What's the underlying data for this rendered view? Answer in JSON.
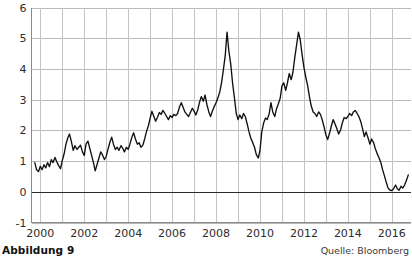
{
  "figure": {
    "caption": "Abbildung 9",
    "source": "Quelle: Bloomberg"
  },
  "chart_data": {
    "type": "line",
    "title": "",
    "subtitle": "",
    "xlabel": "",
    "ylabel": "",
    "xlim": [
      1999.6,
      2016.85
    ],
    "ylim": [
      -1,
      6
    ],
    "grid": true,
    "legend": null,
    "legend_position": "none",
    "y_ticks": [
      6,
      5,
      4,
      3,
      2,
      1,
      0,
      -1
    ],
    "y_tick_labels": [
      "6",
      "5",
      "4",
      "3",
      "2",
      "1",
      "0",
      "-1"
    ],
    "x_ticks": [
      2000,
      2002,
      2004,
      2006,
      2008,
      2010,
      2012,
      2014,
      2016
    ],
    "x_tick_labels": [
      "2000",
      "2002",
      "2004",
      "2006",
      "2008",
      "2010",
      "2012",
      "2014",
      "2016"
    ],
    "x_minor_ticks": [
      2001,
      2003,
      2005,
      2007,
      2009,
      2011,
      2013,
      2015
    ],
    "zero_line": 0,
    "series": [
      {
        "name": "series-1",
        "color": "#101010",
        "x": [
          1999.75,
          1999.83,
          1999.92,
          2000.0,
          2000.08,
          2000.17,
          2000.25,
          2000.33,
          2000.42,
          2000.5,
          2000.58,
          2000.67,
          2000.75,
          2000.83,
          2000.92,
          2001.0,
          2001.08,
          2001.17,
          2001.25,
          2001.33,
          2001.42,
          2001.5,
          2001.58,
          2001.67,
          2001.75,
          2001.83,
          2001.92,
          2002.0,
          2002.08,
          2002.17,
          2002.25,
          2002.33,
          2002.42,
          2002.5,
          2002.58,
          2002.67,
          2002.75,
          2002.83,
          2002.92,
          2003.0,
          2003.08,
          2003.17,
          2003.25,
          2003.33,
          2003.42,
          2003.5,
          2003.58,
          2003.67,
          2003.75,
          2003.83,
          2003.92,
          2004.0,
          2004.08,
          2004.17,
          2004.25,
          2004.33,
          2004.42,
          2004.5,
          2004.58,
          2004.67,
          2004.75,
          2004.83,
          2004.92,
          2005.0,
          2005.08,
          2005.17,
          2005.25,
          2005.33,
          2005.42,
          2005.5,
          2005.58,
          2005.67,
          2005.75,
          2005.83,
          2005.92,
          2006.0,
          2006.08,
          2006.17,
          2006.25,
          2006.33,
          2006.42,
          2006.5,
          2006.58,
          2006.67,
          2006.75,
          2006.83,
          2006.92,
          2007.0,
          2007.08,
          2007.17,
          2007.25,
          2007.33,
          2007.42,
          2007.5,
          2007.58,
          2007.67,
          2007.75,
          2007.83,
          2007.92,
          2008.0,
          2008.08,
          2008.17,
          2008.25,
          2008.33,
          2008.42,
          2008.5,
          2008.58,
          2008.67,
          2008.75,
          2008.83,
          2008.92,
          2009.0,
          2009.08,
          2009.17,
          2009.25,
          2009.33,
          2009.42,
          2009.5,
          2009.58,
          2009.67,
          2009.75,
          2009.83,
          2009.92,
          2010.0,
          2010.08,
          2010.17,
          2010.25,
          2010.33,
          2010.42,
          2010.5,
          2010.58,
          2010.67,
          2010.75,
          2010.83,
          2010.92,
          2011.0,
          2011.08,
          2011.17,
          2011.25,
          2011.33,
          2011.42,
          2011.5,
          2011.58,
          2011.67,
          2011.75,
          2011.83,
          2011.92,
          2012.0,
          2012.08,
          2012.17,
          2012.25,
          2012.33,
          2012.42,
          2012.5,
          2012.58,
          2012.67,
          2012.75,
          2012.83,
          2012.92,
          2013.0,
          2013.08,
          2013.17,
          2013.25,
          2013.33,
          2013.42,
          2013.5,
          2013.58,
          2013.67,
          2013.75,
          2013.83,
          2013.92,
          2014.0,
          2014.08,
          2014.17,
          2014.25,
          2014.33,
          2014.42,
          2014.5,
          2014.58,
          2014.67,
          2014.75,
          2014.83,
          2014.92,
          2015.0,
          2015.08,
          2015.17,
          2015.25,
          2015.33,
          2015.42,
          2015.5,
          2015.58,
          2015.67,
          2015.75,
          2015.83,
          2015.92,
          2016.0,
          2016.08,
          2016.17,
          2016.25,
          2016.33,
          2016.42,
          2016.5,
          2016.58,
          2016.67,
          2016.75
        ],
        "values": [
          0.95,
          0.72,
          0.66,
          0.83,
          0.72,
          0.88,
          0.78,
          0.95,
          0.82,
          1.05,
          0.95,
          1.12,
          0.98,
          0.86,
          0.75,
          1.02,
          1.22,
          1.55,
          1.75,
          1.88,
          1.62,
          1.35,
          1.5,
          1.38,
          1.45,
          1.52,
          1.3,
          1.18,
          1.55,
          1.65,
          1.42,
          1.2,
          0.95,
          0.68,
          0.88,
          1.1,
          1.3,
          1.2,
          1.05,
          1.15,
          1.38,
          1.62,
          1.78,
          1.55,
          1.38,
          1.45,
          1.35,
          1.5,
          1.42,
          1.3,
          1.45,
          1.38,
          1.55,
          1.78,
          1.92,
          1.72,
          1.55,
          1.6,
          1.45,
          1.52,
          1.72,
          1.95,
          2.15,
          2.4,
          2.62,
          2.45,
          2.3,
          2.42,
          2.58,
          2.52,
          2.65,
          2.55,
          2.45,
          2.35,
          2.48,
          2.42,
          2.52,
          2.48,
          2.55,
          2.75,
          2.9,
          2.75,
          2.6,
          2.52,
          2.45,
          2.58,
          2.72,
          2.62,
          2.5,
          2.68,
          2.92,
          3.1,
          2.95,
          3.15,
          2.85,
          2.6,
          2.45,
          2.62,
          2.78,
          2.9,
          3.05,
          3.25,
          3.55,
          3.95,
          4.45,
          5.2,
          4.6,
          4.15,
          3.55,
          3.1,
          2.55,
          2.35,
          2.5,
          2.38,
          2.55,
          2.45,
          2.2,
          1.95,
          1.75,
          1.6,
          1.45,
          1.22,
          1.1,
          1.35,
          1.95,
          2.25,
          2.4,
          2.35,
          2.55,
          2.9,
          2.6,
          2.45,
          2.7,
          2.85,
          3.05,
          3.45,
          3.55,
          3.3,
          3.55,
          3.85,
          3.65,
          3.9,
          4.35,
          4.8,
          5.2,
          4.95,
          4.45,
          4.05,
          3.75,
          3.45,
          3.1,
          2.8,
          2.6,
          2.55,
          2.45,
          2.6,
          2.52,
          2.35,
          2.1,
          1.85,
          1.7,
          1.92,
          2.15,
          2.35,
          2.2,
          2.05,
          1.88,
          2.02,
          2.25,
          2.42,
          2.38,
          2.45,
          2.55,
          2.48,
          2.6,
          2.65,
          2.55,
          2.45,
          2.3,
          2.05,
          1.8,
          1.95,
          1.75,
          1.55,
          1.72,
          1.6,
          1.4,
          1.25,
          1.1,
          0.95,
          0.72,
          0.5,
          0.3,
          0.12,
          0.05,
          0.04,
          0.1,
          0.22,
          0.1,
          0.05,
          0.18,
          0.12,
          0.22,
          0.38,
          0.55
        ]
      }
    ]
  }
}
